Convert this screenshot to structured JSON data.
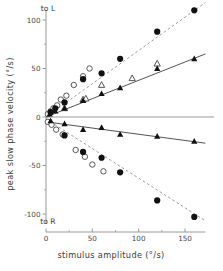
{
  "chart_data": {
    "type": "scatter",
    "title": "",
    "xlabel": "stimulus amplitude (°/s)",
    "ylabel": "peak slow phase velocity (°/s)",
    "xlim": [
      0,
      175
    ],
    "ylim": [
      -110,
      110
    ],
    "xticks": [
      0,
      50,
      100,
      150
    ],
    "xticklabels": [
      "0",
      "50",
      "100",
      "150"
    ],
    "yticks": [
      -100,
      -50,
      0,
      50,
      100
    ],
    "yticklabels": [
      "-100",
      "-50",
      "0",
      "50",
      "100"
    ],
    "yminorticks": [
      -75,
      -25,
      25,
      75
    ],
    "grid": false,
    "legend_position": "none",
    "axis_direction_labels": {
      "top": "to L",
      "bottom": "to R"
    },
    "zero_line": 0,
    "series": [
      {
        "name": "open-circles-to-L",
        "marker": "open-circle",
        "line": "dashed",
        "color": "#555555",
        "points": [
          {
            "x": 2,
            "y": 3
          },
          {
            "x": 5,
            "y": 6
          },
          {
            "x": 8,
            "y": 9
          },
          {
            "x": 12,
            "y": 12
          },
          {
            "x": 16,
            "y": 18
          },
          {
            "x": 22,
            "y": 22
          },
          {
            "x": 30,
            "y": 33
          },
          {
            "x": 40,
            "y": 42
          },
          {
            "x": 47,
            "y": 50
          }
        ]
      },
      {
        "name": "filled-circles-to-L",
        "marker": "filled-circle",
        "line": "dashed",
        "color": "#111111",
        "points": [
          {
            "x": 5,
            "y": 5
          },
          {
            "x": 10,
            "y": 9
          },
          {
            "x": 20,
            "y": 15
          },
          {
            "x": 40,
            "y": 39
          },
          {
            "x": 60,
            "y": 45
          },
          {
            "x": 80,
            "y": 60
          },
          {
            "x": 120,
            "y": 88
          },
          {
            "x": 160,
            "y": 110
          }
        ]
      },
      {
        "name": "open-triangles-to-L",
        "marker": "open-triangle",
        "line": "solid",
        "color": "#555555",
        "points": [
          {
            "x": 20,
            "y": 9
          },
          {
            "x": 40,
            "y": 18
          },
          {
            "x": 43,
            "y": 19
          },
          {
            "x": 60,
            "y": 33
          },
          {
            "x": 93,
            "y": 40
          },
          {
            "x": 120,
            "y": 55
          }
        ]
      },
      {
        "name": "filled-triangles-to-L",
        "marker": "filled-triangle",
        "line": "solid",
        "color": "#111111",
        "points": [
          {
            "x": 4,
            "y": 3
          },
          {
            "x": 10,
            "y": 6
          },
          {
            "x": 20,
            "y": 9
          },
          {
            "x": 40,
            "y": 17
          },
          {
            "x": 60,
            "y": 24
          },
          {
            "x": 80,
            "y": 30
          },
          {
            "x": 120,
            "y": 50
          },
          {
            "x": 160,
            "y": 60
          }
        ]
      },
      {
        "name": "open-circles-to-R",
        "marker": "open-circle",
        "line": "dashed",
        "color": "#555555",
        "points": [
          {
            "x": 2,
            "y": -5
          },
          {
            "x": 6,
            "y": -8
          },
          {
            "x": 11,
            "y": -13
          },
          {
            "x": 18,
            "y": -18
          },
          {
            "x": 32,
            "y": -34
          },
          {
            "x": 42,
            "y": -41
          },
          {
            "x": 50,
            "y": -49
          },
          {
            "x": 62,
            "y": -56
          }
        ]
      },
      {
        "name": "filled-circles-to-R",
        "marker": "filled-circle",
        "line": "dashed",
        "color": "#111111",
        "points": [
          {
            "x": 20,
            "y": -19
          },
          {
            "x": 40,
            "y": -36
          },
          {
            "x": 60,
            "y": -42
          },
          {
            "x": 80,
            "y": -57
          },
          {
            "x": 120,
            "y": -86
          },
          {
            "x": 160,
            "y": -103
          }
        ]
      },
      {
        "name": "filled-triangles-to-R",
        "marker": "filled-triangle",
        "line": "solid",
        "color": "#111111",
        "points": [
          {
            "x": 5,
            "y": -4
          },
          {
            "x": 20,
            "y": -7
          },
          {
            "x": 40,
            "y": -13
          },
          {
            "x": 60,
            "y": -11
          },
          {
            "x": 80,
            "y": -18
          },
          {
            "x": 120,
            "y": -20
          },
          {
            "x": 160,
            "y": -25
          }
        ]
      }
    ],
    "fit_lines": [
      {
        "name": "fit-open-circles-to-L",
        "style": "dashed",
        "x0": 0,
        "y0": 0,
        "x1": 172,
        "y1": 118
      },
      {
        "name": "fit-triangles-to-L",
        "style": "solid",
        "x0": 0,
        "y0": 0,
        "x1": 172,
        "y1": 65
      },
      {
        "name": "fit-triangles-to-R",
        "style": "solid",
        "x0": 0,
        "y0": -5,
        "x1": 172,
        "y1": -27
      },
      {
        "name": "fit-circles-to-R",
        "style": "dashed",
        "x0": 0,
        "y0": -2,
        "x1": 172,
        "y1": -107
      }
    ]
  }
}
